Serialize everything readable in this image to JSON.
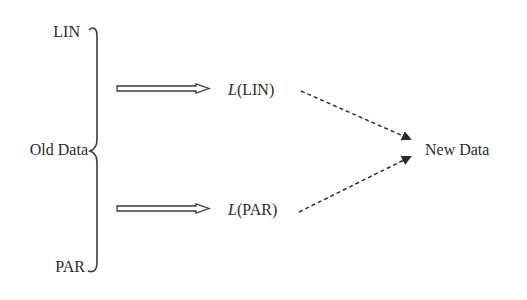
{
  "diagram": {
    "source_group": {
      "label": "Old Data",
      "members": [
        {
          "id": "lin",
          "label": "LIN"
        },
        {
          "id": "par",
          "label": "PAR"
        }
      ]
    },
    "transforms": [
      {
        "from": "LIN",
        "function": "L",
        "arg": "LIN",
        "paren_open": "(",
        "paren_close": ")"
      },
      {
        "from": "PAR",
        "function": "L",
        "arg": "PAR",
        "paren_open": "(",
        "paren_close": ")"
      }
    ],
    "target": {
      "label": "New Data"
    },
    "edges": [
      {
        "from": "Old Data/LIN",
        "to": "L(LIN)",
        "style": "hollow-double-arrow"
      },
      {
        "from": "Old Data/PAR",
        "to": "L(PAR)",
        "style": "hollow-double-arrow"
      },
      {
        "from": "L(LIN)",
        "to": "New Data",
        "style": "dashed-arrow"
      },
      {
        "from": "L(PAR)",
        "to": "New Data",
        "style": "dashed-arrow"
      }
    ],
    "colors": {
      "text": "#2b2b2b",
      "line": "#3a3a3a",
      "background": "#ffffff"
    }
  }
}
